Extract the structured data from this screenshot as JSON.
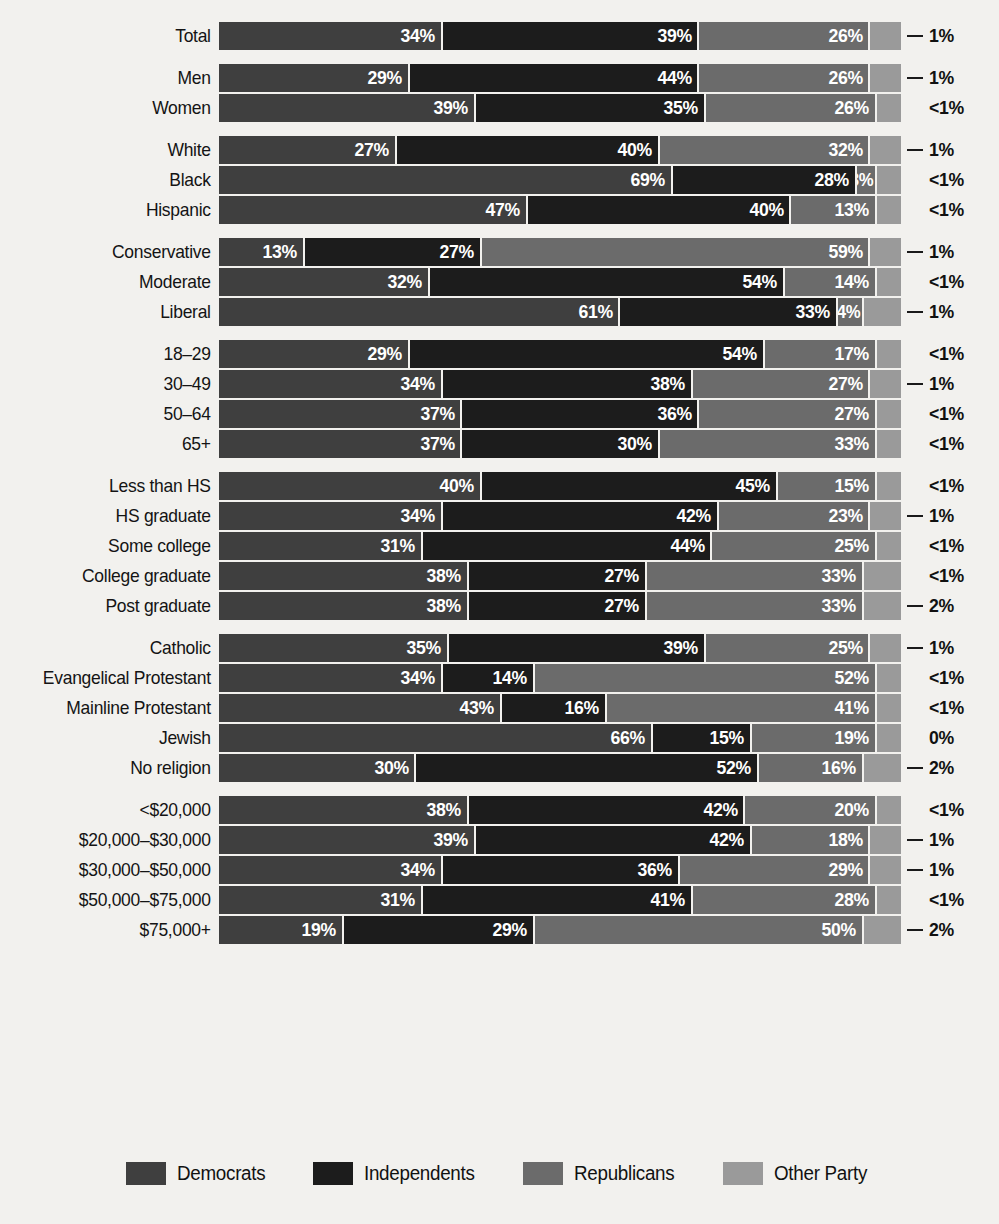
{
  "legend": {
    "items": [
      {
        "label": "Democrats",
        "color": "#3f3f3f",
        "key": "dem"
      },
      {
        "label": "Independents",
        "color": "#1c1c1c",
        "key": "ind"
      },
      {
        "label": "Republicans",
        "color": "#6b6b6b",
        "key": "rep"
      },
      {
        "label": "Other Party",
        "color": "#9a9a9a",
        "key": "oth"
      }
    ]
  },
  "chart_data": {
    "type": "bar",
    "subtype": "stacked-horizontal-100",
    "title": "",
    "xlabel": "",
    "ylabel": "",
    "xlim": [
      0,
      100
    ],
    "grid": false,
    "legend_position": "bottom",
    "series": [
      {
        "name": "Democrats",
        "color": "#3f3f3f"
      },
      {
        "name": "Independents",
        "color": "#1c1c1c"
      },
      {
        "name": "Republicans",
        "color": "#6b6b6b"
      },
      {
        "name": "Other Party",
        "color": "#9a9a9a"
      }
    ],
    "groups": [
      {
        "name": "Total",
        "rows": [
          {
            "label": "Total",
            "values": [
              34,
              39,
              26,
              1
            ],
            "labels": [
              "34%",
              "39%",
              "26%",
              "1%"
            ],
            "other_leader": true
          }
        ]
      },
      {
        "name": "Gender",
        "rows": [
          {
            "label": "Men",
            "values": [
              29,
              44,
              26,
              1
            ],
            "labels": [
              "29%",
              "44%",
              "26%",
              "1%"
            ],
            "other_leader": true
          },
          {
            "label": "Women",
            "values": [
              39,
              35,
              26,
              0.5
            ],
            "labels": [
              "39%",
              "35%",
              "26%",
              "<1%"
            ],
            "other_leader": false
          }
        ]
      },
      {
        "name": "Race",
        "rows": [
          {
            "label": "White",
            "values": [
              27,
              40,
              32,
              1
            ],
            "labels": [
              "27%",
              "40%",
              "32%",
              "1%"
            ],
            "other_leader": true
          },
          {
            "label": "Black",
            "values": [
              69,
              28,
              3,
              0.5
            ],
            "labels": [
              "69%",
              "28%",
              "3%",
              "<1%"
            ],
            "other_leader": false
          },
          {
            "label": "Hispanic",
            "values": [
              47,
              40,
              13,
              0.5
            ],
            "labels": [
              "47%",
              "40%",
              "13%",
              "<1%"
            ],
            "other_leader": false
          }
        ]
      },
      {
        "name": "Ideology",
        "rows": [
          {
            "label": "Conservative",
            "values": [
              13,
              27,
              59,
              1
            ],
            "labels": [
              "13%",
              "27%",
              "59%",
              "1%"
            ],
            "other_leader": true
          },
          {
            "label": "Moderate",
            "values": [
              32,
              54,
              14,
              0.5
            ],
            "labels": [
              "32%",
              "54%",
              "14%",
              "<1%"
            ],
            "other_leader": false
          },
          {
            "label": "Liberal",
            "values": [
              61,
              33,
              4,
              1
            ],
            "labels": [
              "61%",
              "33%",
              "4%",
              "1%"
            ],
            "other_leader": true
          }
        ]
      },
      {
        "name": "Age",
        "rows": [
          {
            "label": "18–29",
            "values": [
              29,
              54,
              17,
              0.5
            ],
            "labels": [
              "29%",
              "54%",
              "17%",
              "<1%"
            ],
            "other_leader": false
          },
          {
            "label": "30–49",
            "values": [
              34,
              38,
              27,
              1
            ],
            "labels": [
              "34%",
              "38%",
              "27%",
              "1%"
            ],
            "other_leader": true
          },
          {
            "label": "50–64",
            "values": [
              37,
              36,
              27,
              0.5
            ],
            "labels": [
              "37%",
              "36%",
              "27%",
              "<1%"
            ],
            "other_leader": false
          },
          {
            "label": "65+",
            "values": [
              37,
              30,
              33,
              0.5
            ],
            "labels": [
              "37%",
              "30%",
              "33%",
              "<1%"
            ],
            "other_leader": false
          }
        ]
      },
      {
        "name": "Education",
        "rows": [
          {
            "label": "Less than HS",
            "values": [
              40,
              45,
              15,
              0.5
            ],
            "labels": [
              "40%",
              "45%",
              "15%",
              "<1%"
            ],
            "other_leader": false
          },
          {
            "label": "HS graduate",
            "values": [
              34,
              42,
              23,
              1
            ],
            "labels": [
              "34%",
              "42%",
              "23%",
              "1%"
            ],
            "other_leader": true
          },
          {
            "label": "Some college",
            "values": [
              31,
              44,
              25,
              0.5
            ],
            "labels": [
              "31%",
              "44%",
              "25%",
              "<1%"
            ],
            "other_leader": false
          },
          {
            "label": "College graduate",
            "values": [
              38,
              27,
              33,
              0.5
            ],
            "labels": [
              "38%",
              "27%",
              "33%",
              "<1%"
            ],
            "other_leader": false
          },
          {
            "label": "Post graduate",
            "values": [
              38,
              27,
              33,
              2
            ],
            "labels": [
              "38%",
              "27%",
              "33%",
              "2%"
            ],
            "other_leader": true
          }
        ]
      },
      {
        "name": "Religion",
        "rows": [
          {
            "label": "Catholic",
            "values": [
              35,
              39,
              25,
              1
            ],
            "labels": [
              "35%",
              "39%",
              "25%",
              "1%"
            ],
            "other_leader": true
          },
          {
            "label": "Evangelical Protestant",
            "values": [
              34,
              14,
              52,
              0.5
            ],
            "labels": [
              "34%",
              "14%",
              "52%",
              "<1%"
            ],
            "other_leader": false
          },
          {
            "label": "Mainline Protestant",
            "values": [
              43,
              16,
              41,
              0.5
            ],
            "labels": [
              "43%",
              "16%",
              "41%",
              "<1%"
            ],
            "other_leader": false
          },
          {
            "label": "Jewish",
            "values": [
              66,
              15,
              19,
              0
            ],
            "labels": [
              "66%",
              "15%",
              "19%",
              "0%"
            ],
            "other_leader": false
          },
          {
            "label": "No religion",
            "values": [
              30,
              52,
              16,
              2
            ],
            "labels": [
              "30%",
              "52%",
              "16%",
              "2%"
            ],
            "other_leader": true
          }
        ]
      },
      {
        "name": "Income",
        "rows": [
          {
            "label": "<$20,000",
            "values": [
              38,
              42,
              20,
              0.5
            ],
            "labels": [
              "38%",
              "42%",
              "20%",
              "<1%"
            ],
            "other_leader": false
          },
          {
            "label": "$20,000–$30,000",
            "values": [
              39,
              42,
              18,
              1
            ],
            "labels": [
              "39%",
              "42%",
              "18%",
              "1%"
            ],
            "other_leader": true
          },
          {
            "label": "$30,000–$50,000",
            "values": [
              34,
              36,
              29,
              1
            ],
            "labels": [
              "34%",
              "36%",
              "29%",
              "1%"
            ],
            "other_leader": true
          },
          {
            "label": "$50,000–$75,000",
            "values": [
              31,
              41,
              28,
              0.5
            ],
            "labels": [
              "31%",
              "41%",
              "28%",
              "<1%"
            ],
            "other_leader": false
          },
          {
            "label": "$75,000+",
            "values": [
              19,
              29,
              50,
              2
            ],
            "labels": [
              "19%",
              "29%",
              "50%",
              "2%"
            ],
            "other_leader": true
          }
        ]
      }
    ]
  }
}
